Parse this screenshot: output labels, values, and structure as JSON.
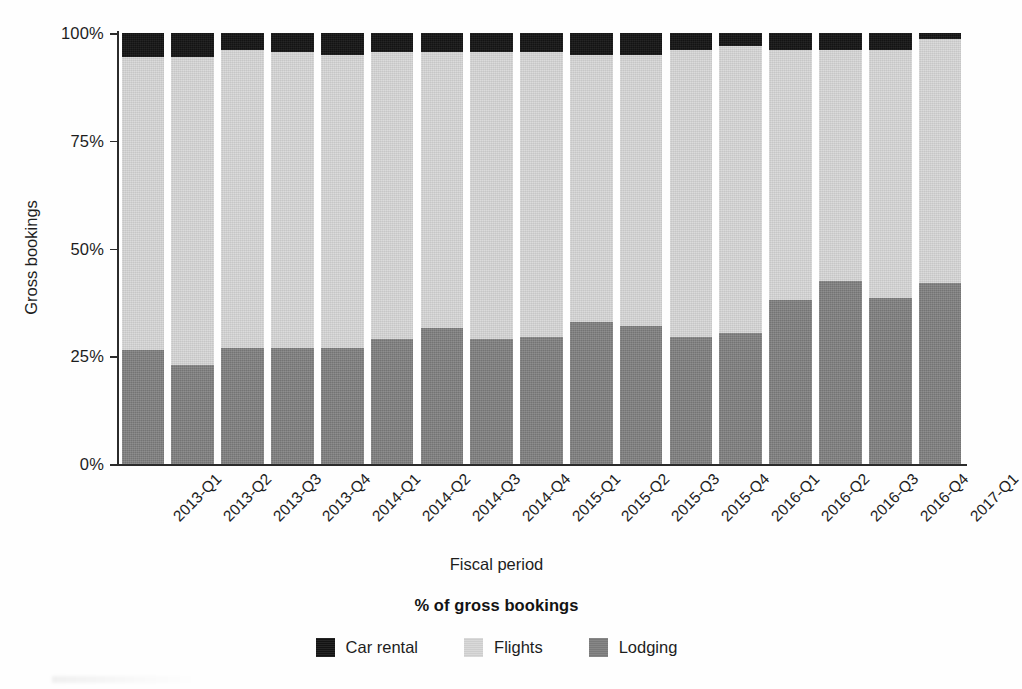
{
  "chart_data": {
    "type": "bar",
    "subtype": "stacked-100-percent",
    "title": "",
    "xlabel": "Fiscal period",
    "ylabel": "Gross bookings",
    "ylim": [
      0,
      100
    ],
    "yticks": [
      "0%",
      "25%",
      "50%",
      "75%",
      "100%"
    ],
    "ytick_values": [
      0,
      25,
      50,
      75,
      100
    ],
    "grid": false,
    "legend_title": "% of gross bookings",
    "legend_position": "bottom",
    "categories": [
      "2013-Q1",
      "2013-Q2",
      "2013-Q3",
      "2013-Q4",
      "2014-Q1",
      "2014-Q2",
      "2014-Q3",
      "2014-Q4",
      "2015-Q1",
      "2015-Q2",
      "2015-Q3",
      "2015-Q4",
      "2016-Q1",
      "2016-Q2",
      "2016-Q3",
      "2016-Q4",
      "2017-Q1"
    ],
    "series": [
      {
        "name": "Lodging",
        "color": "#7e7e7e",
        "values": [
          26.5,
          23.0,
          27.0,
          27.0,
          27.0,
          29.0,
          31.5,
          29.0,
          29.5,
          33.0,
          32.0,
          29.5,
          30.5,
          38.0,
          42.5,
          38.5,
          42.0
        ]
      },
      {
        "name": "Flights",
        "color": "#d6d6d6",
        "values": [
          68.0,
          71.5,
          69.0,
          68.5,
          68.0,
          66.5,
          64.0,
          66.5,
          66.0,
          62.0,
          63.0,
          66.5,
          66.5,
          58.0,
          53.5,
          57.5,
          56.5
        ]
      },
      {
        "name": "Car rental",
        "color": "#141414",
        "values": [
          5.5,
          5.5,
          4.0,
          4.5,
          5.0,
          4.5,
          4.5,
          4.5,
          4.5,
          5.0,
          5.0,
          4.0,
          3.0,
          4.0,
          4.0,
          4.0,
          1.5
        ]
      }
    ],
    "stack_order_bottom_to_top": [
      "Lodging",
      "Flights",
      "Car rental"
    ]
  },
  "legend": {
    "title": "% of gross bookings",
    "items": [
      {
        "label": "Car rental",
        "color": "#141414"
      },
      {
        "label": "Flights",
        "color": "#d6d6d6"
      },
      {
        "label": "Lodging",
        "color": "#7e7e7e"
      }
    ]
  },
  "axes": {
    "x_title": "Fiscal period",
    "y_title": "Gross bookings"
  }
}
